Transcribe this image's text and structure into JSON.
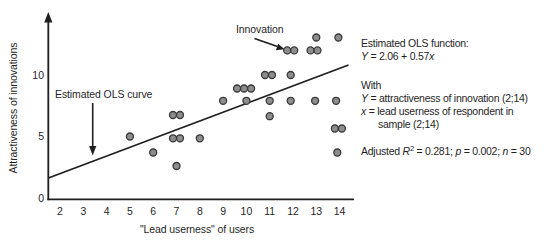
{
  "figure": {
    "background": "#ffffff",
    "ink": "#1f1f1f",
    "dot_fill": "#8d8d8d",
    "dot_stroke": "#383838"
  },
  "axes": {
    "y_label": "Attractiveness of innovations",
    "x_label": "\"Lead userness\" of users",
    "x_ticks": [
      2,
      3,
      4,
      5,
      6,
      7,
      8,
      9,
      10,
      11,
      12,
      13,
      14
    ],
    "y_ticks": [
      0,
      5,
      10
    ],
    "xlim": [
      2,
      14
    ],
    "ylim": [
      0,
      14
    ]
  },
  "annotations": {
    "ols_curve_label": "Estimated OLS curve",
    "innovation_label": "Innovation"
  },
  "chart_data": {
    "type": "scatter",
    "title": "",
    "xlabel": "\"Lead userness\" of users",
    "ylabel": "Attractiveness of innovations",
    "xlim": [
      2,
      14
    ],
    "ylim": [
      0,
      14
    ],
    "x_ticks": [
      2,
      3,
      4,
      5,
      6,
      7,
      8,
      9,
      10,
      11,
      12,
      13,
      14
    ],
    "y_ticks": [
      0,
      5,
      10
    ],
    "grid": false,
    "points": [
      [
        5,
        5
      ],
      [
        6,
        3.7
      ],
      [
        6.85,
        6.75
      ],
      [
        7.15,
        6.75
      ],
      [
        6.85,
        4.85
      ],
      [
        7.15,
        4.85
      ],
      [
        7,
        2.6
      ],
      [
        8,
        4.85
      ],
      [
        9,
        7.9
      ],
      [
        9.6,
        8.9
      ],
      [
        9.9,
        8.9
      ],
      [
        10.2,
        8.9
      ],
      [
        10,
        7.9
      ],
      [
        10.8,
        10
      ],
      [
        11.1,
        10
      ],
      [
        11,
        6.65
      ],
      [
        11,
        7.9
      ],
      [
        11.9,
        10
      ],
      [
        11.9,
        7.9
      ],
      [
        11.75,
        12
      ],
      [
        12.05,
        12
      ],
      [
        12.75,
        12
      ],
      [
        13.05,
        12
      ],
      [
        13,
        13.05
      ],
      [
        13.95,
        13.05
      ],
      [
        12.95,
        7.9
      ],
      [
        13.8,
        5.65
      ],
      [
        14.1,
        5.65
      ],
      [
        13.85,
        7.9
      ],
      [
        13.9,
        3.7
      ]
    ],
    "ols_line": {
      "x1": 1.5,
      "y1": 1.63,
      "x2": 14.38,
      "y2": 10.81
    },
    "ols_function": "Y = 2.06 + 0.57x",
    "adjusted_r2": 0.281,
    "p_value": 0.002,
    "n": 30
  },
  "info_panel": {
    "lines": [
      {
        "segments": [
          {
            "t": "Estimated OLS function:"
          }
        ]
      },
      {
        "segments": [
          {
            "t": "Y",
            "i": true
          },
          {
            "t": " = 2.06 + 0.57"
          },
          {
            "t": "x",
            "i": true
          }
        ]
      },
      {
        "gap": 16,
        "segments": [
          {
            "t": "With"
          }
        ]
      },
      {
        "segments": [
          {
            "t": "Y",
            "i": true
          },
          {
            "t": " = attractiveness of innovation (2;14)"
          }
        ]
      },
      {
        "segments": [
          {
            "t": "x",
            "i": true
          },
          {
            "t": " = lead userness of respondent in"
          }
        ]
      },
      {
        "indent": 17,
        "segments": [
          {
            "t": "sample (2;14)"
          }
        ]
      },
      {
        "gap": 14,
        "segments": [
          {
            "t": "Adjusted "
          },
          {
            "t": "R",
            "i": true
          },
          {
            "t": "2",
            "sup": true
          },
          {
            "t": " = 0.281; "
          },
          {
            "t": "p",
            "i": true
          },
          {
            "t": " = 0.002; "
          },
          {
            "t": "n",
            "i": true
          },
          {
            "t": " = 30"
          }
        ]
      }
    ]
  }
}
